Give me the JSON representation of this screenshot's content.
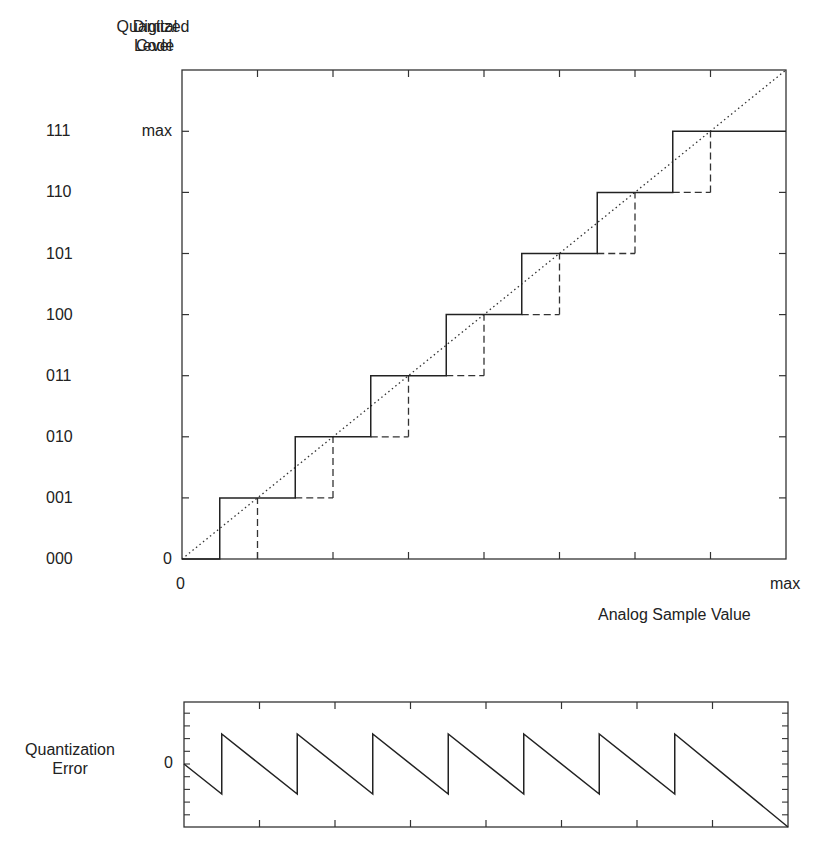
{
  "headers": {
    "digital_code_line1": "Digital",
    "digital_code_line2": "Code",
    "quantized_level_line1": "Quantized",
    "quantized_level_line2": "Level"
  },
  "main_plot": {
    "y_codes": [
      "000",
      "001",
      "010",
      "011",
      "100",
      "101",
      "110",
      "111"
    ],
    "y_level_labels": {
      "zero": "0",
      "max": "max"
    },
    "x_labels": {
      "zero": "0",
      "max": "max"
    },
    "x_axis_title": "Analog Sample Value",
    "num_levels": 8,
    "step_width_units": 1,
    "x_range_units": 8,
    "legend": {
      "solid": "quantizer output (rounding)",
      "dashed": "quantizer output (truncation)",
      "dotted": "ideal linear transfer"
    }
  },
  "error_plot": {
    "y_label_line1": "Quantization",
    "y_label_line2": "Error",
    "zero_label": "0",
    "teeth": 7
  },
  "chart_data": [
    {
      "type": "line",
      "title": "Quantizer Transfer Characteristic",
      "xlabel": "Analog Sample Value",
      "ylabel": "Quantized Level / Digital Code",
      "x_ticks": [
        "0",
        "max"
      ],
      "y_ticks": [
        "000",
        "001",
        "010",
        "011",
        "100",
        "101",
        "110",
        "111"
      ],
      "y_tick_values": [
        "0",
        "",
        "",
        "",
        "",
        "",
        "",
        "max"
      ],
      "xlim": [
        0,
        8
      ],
      "ylim": [
        0,
        8
      ],
      "series": [
        {
          "name": "rounding (solid)",
          "x": [
            0,
            0.5,
            0.5,
            1.5,
            1.5,
            2.5,
            2.5,
            3.5,
            3.5,
            4.5,
            4.5,
            5.5,
            5.5,
            6.5,
            6.5,
            8
          ],
          "y": [
            0,
            0,
            1,
            1,
            2,
            2,
            3,
            3,
            4,
            4,
            5,
            5,
            6,
            6,
            7,
            7
          ]
        },
        {
          "name": "truncation (dashed)",
          "x": [
            1,
            1,
            2,
            2,
            3,
            3,
            4,
            4,
            5,
            5,
            6,
            6,
            7,
            7
          ],
          "y": [
            0,
            1,
            1,
            2,
            2,
            3,
            3,
            4,
            4,
            5,
            5,
            6,
            6,
            7
          ]
        },
        {
          "name": "ideal (dotted)",
          "x": [
            0,
            8
          ],
          "y": [
            0,
            8
          ]
        }
      ],
      "grid": false
    },
    {
      "type": "line",
      "title": "Quantization Error",
      "ylabel": "Quantization Error",
      "y_ticks": [
        "0"
      ],
      "xlim": [
        0,
        8
      ],
      "ylim": [
        -1,
        1
      ],
      "series": [
        {
          "name": "error",
          "x": [
            0,
            0.5,
            0.5,
            1.5,
            1.5,
            2.5,
            2.5,
            3.5,
            3.5,
            4.5,
            4.5,
            5.5,
            5.5,
            6.5,
            6.5,
            8
          ],
          "y": [
            0,
            -0.5,
            0.5,
            -0.5,
            0.5,
            -0.5,
            0.5,
            -0.5,
            0.5,
            -0.5,
            0.5,
            -0.5,
            0.5,
            -0.5,
            0.5,
            -1.5
          ]
        }
      ],
      "grid": false
    }
  ]
}
